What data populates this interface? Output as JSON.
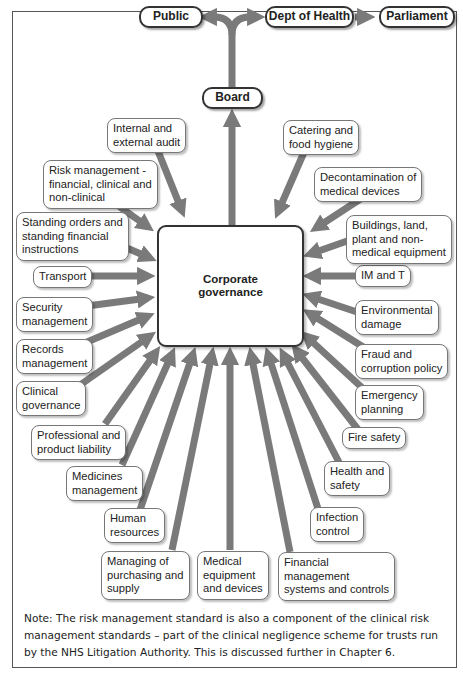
{
  "top_flow": {
    "public": "Public",
    "dept_of_health": "Dept of Health",
    "parliament": "Parliament",
    "board": "Board"
  },
  "center": {
    "label": "Corporate\ngovernance"
  },
  "nodes": [
    {
      "id": "internal-external-audit",
      "label": "Internal and\nexternal audit"
    },
    {
      "id": "risk-management",
      "label": "Risk management -\nfinancial, clinical and\nnon-clinical"
    },
    {
      "id": "standing-orders",
      "label": "Standing orders and\nstanding financial\ninstructions"
    },
    {
      "id": "transport",
      "label": "Transport"
    },
    {
      "id": "security-management",
      "label": "Security\nmanagement"
    },
    {
      "id": "records-management",
      "label": "Records\nmanagement"
    },
    {
      "id": "clinical-governance",
      "label": "Clinical\ngovernance"
    },
    {
      "id": "professional-product-liability",
      "label": "Professional and\nproduct liability"
    },
    {
      "id": "medicines-management",
      "label": "Medicines\nmanagement"
    },
    {
      "id": "human-resources",
      "label": "Human\nresources"
    },
    {
      "id": "managing-purchasing-supply",
      "label": "Managing of\npurchasing and\nsupply"
    },
    {
      "id": "medical-equipment-devices",
      "label": "Medical\nequipment\nand devices"
    },
    {
      "id": "financial-management",
      "label": "Financial\nmanagement\nsystems and controls"
    },
    {
      "id": "infection-control",
      "label": "Infection\ncontrol"
    },
    {
      "id": "health-and-safety",
      "label": "Health and\nsafety"
    },
    {
      "id": "fire-safety",
      "label": "Fire safety"
    },
    {
      "id": "emergency-planning",
      "label": "Emergency\nplanning"
    },
    {
      "id": "fraud-corruption-policy",
      "label": "Fraud and\ncorruption policy"
    },
    {
      "id": "environmental-damage",
      "label": "Environmental\ndamage"
    },
    {
      "id": "im-and-t",
      "label": "IM and T"
    },
    {
      "id": "buildings-land-plant",
      "label": "Buildings, land,\nplant and non-\nmedical equipment"
    },
    {
      "id": "decontamination",
      "label": "Decontamination of\nmedical devices"
    },
    {
      "id": "catering-food-hygiene",
      "label": "Catering and\nfood hygiene"
    }
  ],
  "note": "Note: The risk management standard is also a component of the clinical risk management standards – part of the clinical negligence scheme for trusts run by the NHS Litigation Authority. This is discussed further in Chapter 6.",
  "colors": {
    "arrow": "#7a7a7a",
    "border": "#333333"
  }
}
